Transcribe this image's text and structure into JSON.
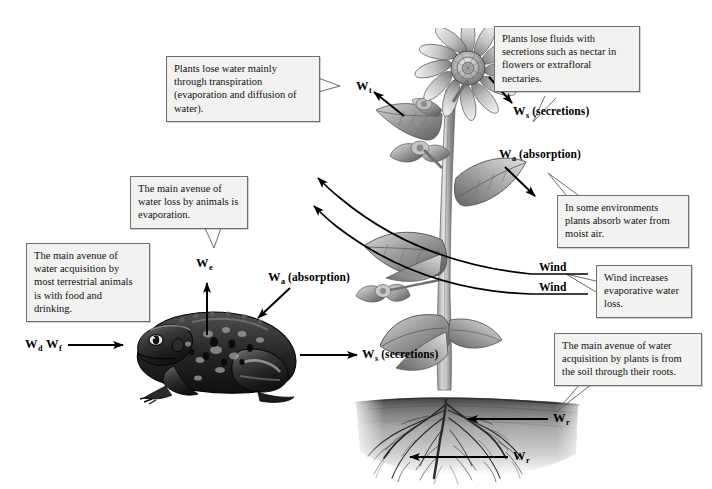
{
  "figure": {
    "background_color": "#ffffff",
    "line_color": "#000000",
    "callout_fill": "#f2f2f0",
    "callout_border": "#6e6e6e"
  },
  "callouts": [
    {
      "id": "transpiration",
      "text": "Plants lose water mainly through transpiration (evaporation and diffusion of water)."
    },
    {
      "id": "secretions-plant",
      "text": "Plants lose fluids with secretions such as nectar in flowers or extrafloral nectaries."
    },
    {
      "id": "absorption-air",
      "text": "In some environments plants absorb water from moist air."
    },
    {
      "id": "wind-evaporative",
      "text": "Wind increases evaporative water loss."
    },
    {
      "id": "roots-acquisition",
      "text": "The main avenue of water acquisition by plants is from the soil through their roots."
    },
    {
      "id": "animal-evaporation",
      "text": "The main avenue of water loss by animals is evaporation."
    },
    {
      "id": "animal-acquisition",
      "text": "The main avenue of water acquisition by most terrestrial animals is with food and drinking."
    }
  ],
  "labels": {
    "transpiration": {
      "symbol": "W",
      "subscript": "t",
      "note": ""
    },
    "secretions_plant": {
      "symbol": "W",
      "subscript": "s",
      "note": "(secretions)"
    },
    "absorption_plant": {
      "symbol": "W",
      "subscript": "a",
      "note": "(absorption)"
    },
    "evaporation_animal": {
      "symbol": "W",
      "subscript": "e",
      "note": ""
    },
    "absorption_animal": {
      "symbol": "W",
      "subscript": "a",
      "note": "(absorption)"
    },
    "drinking": {
      "symbol": "W",
      "subscript": "d",
      "note": ""
    },
    "food": {
      "symbol": "W",
      "subscript": "f",
      "note": ""
    },
    "secretions_animal": {
      "symbol": "W",
      "subscript": "s",
      "note": "(secretions)"
    },
    "roots_upper": {
      "symbol": "W",
      "subscript": "r",
      "note": ""
    },
    "roots_lower": {
      "symbol": "W",
      "subscript": "r",
      "note": ""
    },
    "wind_upper": "Wind",
    "wind_lower": "Wind"
  },
  "artwork": {
    "plant": "grayscale-sunflower-plant",
    "animal": "grayscale-toad",
    "soil": "grayscale-soil-cross-section",
    "roots": "grayscale-root-system"
  }
}
